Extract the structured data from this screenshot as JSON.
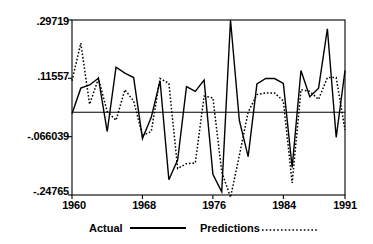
{
  "chart_data": {
    "type": "line",
    "title": "",
    "subtitle": "",
    "xlabel": "",
    "ylabel": "",
    "grid": false,
    "legend_position": "bottom",
    "xlim": [
      1960,
      1991
    ],
    "ylim": [
      -0.24765,
      0.29719
    ],
    "x_tick_labels": [
      "1960",
      "1968",
      "1976",
      "1984",
      "1991"
    ],
    "x_tick_values": [
      1960,
      1968,
      1976,
      1984,
      1991
    ],
    "y_tick_labels": [
      ".29719",
      ".11557",
      "-.066039",
      "-.24765"
    ],
    "y_tick_values": [
      0.29719,
      0.11557,
      -0.066039,
      -0.24765
    ],
    "reference_line": 0.01,
    "x": [
      1960,
      1961,
      1962,
      1963,
      1964,
      1965,
      1966,
      1967,
      1968,
      1969,
      1970,
      1971,
      1972,
      1973,
      1974,
      1975,
      1976,
      1977,
      1978,
      1979,
      1980,
      1981,
      1982,
      1983,
      1984,
      1985,
      1986,
      1987,
      1988,
      1989,
      1990,
      1991
    ],
    "series": [
      {
        "name": "Actual",
        "style": "solid",
        "color": "#000000",
        "values": [
          0.005,
          0.085,
          0.095,
          0.116,
          -0.05,
          0.15,
          0.132,
          0.118,
          -0.072,
          -0.006,
          0.108,
          -0.2,
          -0.138,
          0.09,
          0.075,
          0.11,
          -0.183,
          -0.238,
          0.297,
          -0.015,
          -0.128,
          0.098,
          0.115,
          0.115,
          0.1,
          -0.162,
          0.14,
          0.058,
          0.085,
          0.27,
          -0.068,
          0.14
        ]
      },
      {
        "name": "Predictions",
        "style": "dotted",
        "color": "#000000",
        "values": [
          0.108,
          0.225,
          0.035,
          0.115,
          0.012,
          -0.015,
          0.08,
          0.045,
          -0.062,
          -0.05,
          0.115,
          0.1,
          -0.165,
          -0.15,
          -0.148,
          0.06,
          0.055,
          -0.175,
          -0.255,
          -0.125,
          0.01,
          0.065,
          0.07,
          0.07,
          0.045,
          -0.21,
          0.08,
          0.075,
          0.05,
          0.118,
          0.118,
          -0.045
        ]
      }
    ]
  },
  "legend": {
    "entries": [
      {
        "label": "Actual",
        "style": "solid"
      },
      {
        "label": "Predictions",
        "style": "dotted"
      }
    ]
  }
}
